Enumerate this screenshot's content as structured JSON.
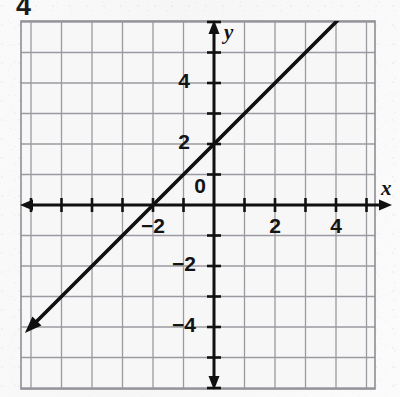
{
  "page": {
    "number": "4",
    "bleed_through": [
      "ASSESSMENT",
      "FOR YOUR NOTES",
      "THE MATH LESSON",
      "EXTRA"
    ]
  },
  "chart_data": {
    "type": "line",
    "title": "",
    "xlabel": "x",
    "ylabel": "y",
    "xlim": [
      -6.3,
      5.3
    ],
    "ylim": [
      -6.0,
      6.0
    ],
    "grid": true,
    "grid_step": 1,
    "legend": "none",
    "x_tick_labels": [
      "-2",
      "0",
      "2",
      "4"
    ],
    "x_tick_values": [
      -2,
      0,
      2,
      4
    ],
    "y_tick_labels": [
      "4",
      "2",
      "-2",
      "-4"
    ],
    "y_tick_values": [
      4,
      2,
      -2,
      -4
    ],
    "series": [
      {
        "name": "y = x + 2",
        "equation": "y = x + 2",
        "slope": 1,
        "y_intercept": 2,
        "x_intercept": -2,
        "arrows": "both",
        "x": [
          -6.2,
          5.4
        ],
        "y": [
          -4.2,
          7.4
        ],
        "points": [
          {
            "x": -2,
            "y": 0
          },
          {
            "x": 0,
            "y": 2
          },
          {
            "x": 2,
            "y": 4
          },
          {
            "x": 4,
            "y": 6
          }
        ]
      }
    ],
    "colors": {
      "line": "#101010",
      "axis": "#111111",
      "grid": "#9a9aa0",
      "background": "#f7f7f8"
    }
  }
}
